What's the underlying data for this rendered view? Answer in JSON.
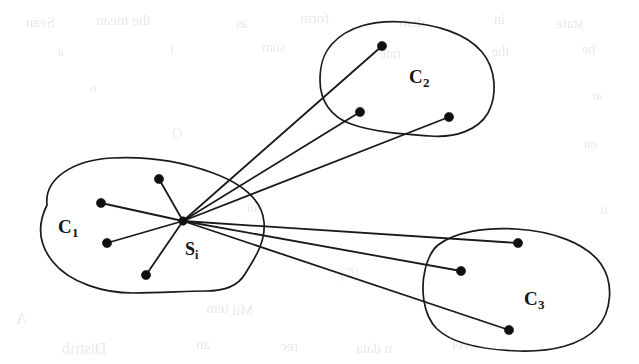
{
  "figure": {
    "background_color": "#ffffff",
    "ink_color": "#141414",
    "width": 639,
    "height": 364
  },
  "clusters": [
    {
      "id": "c1",
      "label_main": "C",
      "label_sub": "1",
      "label_x": 58,
      "label_y": 233,
      "outline_path": "M 183 221 C 183 221 183 221 183 221 M 47 205 C 44 178 74 160 112 158 C 150 156 186 163 213 173 C 240 183 262 199 264 222 C 266 244 252 262 245 274 C 238 286 225 291 206 291 C 186 291 160 293 133 293 C 104 293 70 283 53 262 C 40 246 36 227 47 205 Z",
      "members": [
        {
          "id": "c1-n1",
          "x": 159,
          "y": 179
        },
        {
          "id": "c1-n2",
          "x": 101,
          "y": 203
        },
        {
          "id": "c1-n3",
          "x": 107,
          "y": 243
        },
        {
          "id": "c1-n4",
          "x": 146,
          "y": 275
        }
      ]
    },
    {
      "id": "c2",
      "label_main": "C",
      "label_sub": "2",
      "label_x": 409,
      "label_y": 83,
      "outline_path": "M 332 44 C 348 26 375 20 403 22 C 435 24 466 33 482 52 C 497 70 497 96 488 113 C 478 130 456 138 430 136 C 403 134 373 132 351 124 C 331 117 320 101 320 80 C 320 63 324 53 332 44 Z",
      "members": [
        {
          "id": "c2-n1",
          "x": 382,
          "y": 46
        },
        {
          "id": "c2-n2",
          "x": 360,
          "y": 112
        },
        {
          "id": "c2-n3",
          "x": 449,
          "y": 117
        }
      ]
    },
    {
      "id": "c3",
      "label_main": "C",
      "label_sub": "3",
      "label_x": 524,
      "label_y": 305,
      "outline_path": "M 438 245 C 455 232 485 227 516 229 C 552 231 586 243 601 264 C 614 283 612 311 597 328 C 581 345 552 352 519 351 C 486 350 453 344 437 329 C 422 314 421 287 425 270 C 428 257 432 250 438 245 Z",
      "members": [
        {
          "id": "c3-n1",
          "x": 518,
          "y": 243
        },
        {
          "id": "c3-n2",
          "x": 461,
          "y": 271
        },
        {
          "id": "c3-n3",
          "x": 509,
          "y": 330
        }
      ]
    }
  ],
  "hub": {
    "id": "si",
    "label_main": "S",
    "label_sub": "i",
    "x": 183,
    "y": 221,
    "label_x": 185,
    "label_y": 255
  },
  "edges": [
    {
      "from": "si",
      "to": "c1-n1"
    },
    {
      "from": "si",
      "to": "c1-n2"
    },
    {
      "from": "si",
      "to": "c1-n3"
    },
    {
      "from": "si",
      "to": "c1-n4"
    },
    {
      "from": "si",
      "to": "c2-n1"
    },
    {
      "from": "si",
      "to": "c2-n2"
    },
    {
      "from": "si",
      "to": "c2-n3"
    },
    {
      "from": "si",
      "to": "c3-n1"
    },
    {
      "from": "si",
      "to": "c3-n2"
    },
    {
      "from": "si",
      "to": "c3-n3"
    }
  ],
  "ghost_text": [
    {
      "text": "Sean",
      "x": 26,
      "y": 14,
      "size": 15
    },
    {
      "text": "the mean",
      "x": 96,
      "y": 12,
      "size": 15
    },
    {
      "text": "as",
      "x": 236,
      "y": 16,
      "size": 14
    },
    {
      "text": "form",
      "x": 300,
      "y": 10,
      "size": 15
    },
    {
      "text": "distr",
      "x": 398,
      "y": 14,
      "size": 15
    },
    {
      "text": "in",
      "x": 494,
      "y": 12,
      "size": 14
    },
    {
      "text": "state",
      "x": 556,
      "y": 15,
      "size": 15
    },
    {
      "text": "a",
      "x": 58,
      "y": 44,
      "size": 13
    },
    {
      "text": "l",
      "x": 170,
      "y": 42,
      "size": 13
    },
    {
      "text": "sum",
      "x": 262,
      "y": 40,
      "size": 14
    },
    {
      "text": "rate",
      "x": 380,
      "y": 46,
      "size": 14
    },
    {
      "text": "the",
      "x": 492,
      "y": 44,
      "size": 14
    },
    {
      "text": "be",
      "x": 582,
      "y": 42,
      "size": 14
    },
    {
      "text": "o",
      "x": 90,
      "y": 80,
      "size": 13
    },
    {
      "text": "ar",
      "x": 592,
      "y": 88,
      "size": 13
    },
    {
      "text": "O",
      "x": 172,
      "y": 126,
      "size": 14
    },
    {
      "text": "on",
      "x": 584,
      "y": 136,
      "size": 13
    },
    {
      "text": "or",
      "x": 246,
      "y": 200,
      "size": 13
    },
    {
      "text": "ti",
      "x": 600,
      "y": 202,
      "size": 13
    },
    {
      "text": "(C)",
      "x": 340,
      "y": 266,
      "size": 14
    },
    {
      "text": "tem",
      "x": 206,
      "y": 300,
      "size": 15
    },
    {
      "text": "A",
      "x": 16,
      "y": 310,
      "size": 16
    },
    {
      "text": "Mil",
      "x": 232,
      "y": 302,
      "size": 15
    },
    {
      "text": "Distrib",
      "x": 62,
      "y": 340,
      "size": 16
    },
    {
      "text": "an",
      "x": 196,
      "y": 336,
      "size": 15
    },
    {
      "text": "rec",
      "x": 280,
      "y": 338,
      "size": 15
    },
    {
      "text": "n data",
      "x": 356,
      "y": 340,
      "size": 15
    },
    {
      "text": "vel",
      "x": 452,
      "y": 336,
      "size": 15
    }
  ]
}
